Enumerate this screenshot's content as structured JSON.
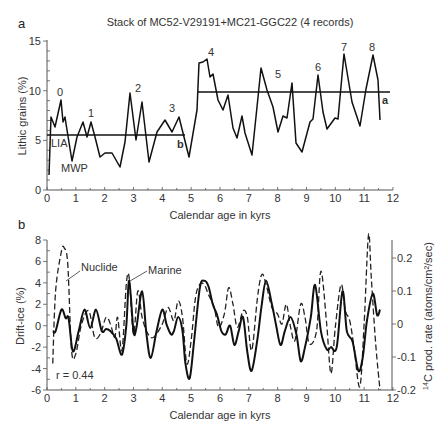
{
  "chart_data": [
    {
      "panel": "a",
      "type": "line",
      "title": "Stack of MC52-V29191+MC21-GGC22 (4 records)",
      "xlabel": "Calendar age in kyrs",
      "ylabel": "Lithic grains (%)",
      "xlim": [
        0,
        12
      ],
      "ylim": [
        0,
        15
      ],
      "xticks": [
        "0",
        "1",
        "2",
        "3",
        "4",
        "5",
        "6",
        "7",
        "8",
        "9",
        "10",
        "11",
        "12"
      ],
      "yticks": [
        "0",
        "5",
        "10",
        "15"
      ],
      "series": [
        {
          "name": "Lithic grains stack",
          "x": [
            0.07,
            0.14,
            0.28,
            0.49,
            0.55,
            0.62,
            0.69,
            0.87,
            1.04,
            1.25,
            1.39,
            1.53,
            1.66,
            1.84,
            2.01,
            2.25,
            2.53,
            2.71,
            2.88,
            3.09,
            3.3,
            3.54,
            3.82,
            4.09,
            4.34,
            4.58,
            4.75,
            4.93,
            5.2,
            5.27,
            5.41,
            5.55,
            5.65,
            5.76,
            5.93,
            6.1,
            6.27,
            6.42,
            6.6,
            6.73,
            6.9,
            7.11,
            7.28,
            7.42,
            7.63,
            7.84,
            8.01,
            8.18,
            8.32,
            8.5,
            8.64,
            8.85,
            9.12,
            9.23,
            9.4,
            9.58,
            9.71,
            9.99,
            10.09,
            10.3,
            10.58,
            10.79,
            11.03,
            11.2,
            11.3,
            11.55
          ],
          "y": [
            1.5,
            7.3,
            6.3,
            9.0,
            6.8,
            7.3,
            6.0,
            2.9,
            5.4,
            6.9,
            5.4,
            6.9,
            5.4,
            3.3,
            3.7,
            3.7,
            2.3,
            4.8,
            9.7,
            5.0,
            8.8,
            2.8,
            5.8,
            7.0,
            5.8,
            7.3,
            5.3,
            3.3,
            8.1,
            12.8,
            12.9,
            13.2,
            11.4,
            11.7,
            9.2,
            8.1,
            9.6,
            6.3,
            5.3,
            7.5,
            5.8,
            3.5,
            8.4,
            12.3,
            10.1,
            8.4,
            5.8,
            7.5,
            7.3,
            10.8,
            4.8,
            3.9,
            6.9,
            7.2,
            11.6,
            7.9,
            6.2,
            7.3,
            7.2,
            13.7,
            8.9,
            6.4,
            10.1,
            13.6,
            11.1,
            7.0
          ]
        }
      ],
      "reference_lines": [
        {
          "label": "b",
          "y": 5.5,
          "x_range": [
            0,
            4.8
          ]
        },
        {
          "label": "a",
          "y": 9.9,
          "x_range": [
            5.2,
            12
          ]
        }
      ],
      "annotations": [
        "0",
        "1",
        "2",
        "3",
        "4",
        "5",
        "6",
        "7",
        "8",
        "LIA",
        "MWP",
        "a",
        "b"
      ]
    },
    {
      "panel": "b",
      "type": "line",
      "xlabel": "Calendar age in kyrs",
      "ylabel": "Drift-ice (%)",
      "ylabel_right": "14C prod. rate (atoms/cm2/sec)",
      "xlim": [
        0,
        12
      ],
      "ylim": [
        -6,
        8
      ],
      "ylim_right": [
        -0.2,
        0.25
      ],
      "xticks": [
        "0",
        "1",
        "2",
        "3",
        "4",
        "5",
        "6",
        "7",
        "8",
        "9",
        "10",
        "11",
        "12"
      ],
      "yticks": [
        "-6",
        "-4",
        "-2",
        "0",
        "2",
        "4",
        "6",
        "8"
      ],
      "yticks_right": [
        "-0.2",
        "-0.1",
        "0",
        "0.1",
        "0.2"
      ],
      "series": [
        {
          "name": "Marine",
          "style": "solid",
          "axis": "left",
          "x": [
            0.2,
            0.3,
            0.5,
            0.65,
            0.75,
            0.9,
            1.1,
            1.3,
            1.5,
            1.7,
            1.9,
            2.05,
            2.2,
            2.4,
            2.6,
            2.75,
            2.85,
            3.0,
            3.1,
            3.3,
            3.45,
            3.6,
            3.8,
            4.0,
            4.15,
            4.3,
            4.4,
            4.55,
            4.7,
            4.8,
            4.95,
            5.1,
            5.3,
            5.45,
            5.6,
            5.75,
            5.9,
            6.05,
            6.2,
            6.35,
            6.5,
            6.65,
            6.8,
            6.95,
            7.1,
            7.3,
            7.45,
            7.6,
            7.8,
            7.95,
            8.1,
            8.25,
            8.45,
            8.65,
            8.8,
            8.95,
            9.15,
            9.3,
            9.5,
            9.7,
            9.85,
            10.05,
            10.25,
            10.4,
            10.6,
            10.8,
            10.95,
            11.1,
            11.3,
            11.45,
            11.55
          ],
          "y": [
            -0.5,
            -0.5,
            1.5,
            0.7,
            0.7,
            -2.4,
            -0.5,
            1.5,
            -0.2,
            1.5,
            -0.5,
            -0.3,
            -0.5,
            -1.2,
            -2.7,
            0.0,
            4.2,
            -0.5,
            -0.2,
            3.2,
            -0.8,
            -3.0,
            -0.5,
            1.5,
            0.1,
            -0.8,
            -0.5,
            0.8,
            -0.5,
            -3.5,
            -4.9,
            -1.5,
            3.5,
            4.2,
            3.7,
            2.0,
            1.0,
            -0.5,
            -0.8,
            0.0,
            -1.8,
            -0.5,
            0.8,
            -2.5,
            -4.2,
            -1.2,
            2.0,
            4.2,
            2.0,
            0.0,
            -1.8,
            -0.5,
            0.8,
            -0.8,
            -3.3,
            -2.0,
            0.8,
            3.8,
            -0.5,
            -2.2,
            -2.0,
            -2.0,
            3.2,
            -0.5,
            -1.5,
            -4.2,
            -3.0,
            0.5,
            3.0,
            1.0,
            1.5
          ]
        },
        {
          "name": "Nuclide",
          "style": "dashed",
          "axis": "right",
          "x": [
            0.2,
            0.3,
            0.5,
            0.6,
            0.72,
            0.85,
            1.0,
            1.2,
            1.45,
            1.65,
            1.85,
            2.05,
            2.2,
            2.35,
            2.45,
            2.6,
            2.75,
            2.85,
            3.0,
            3.15,
            3.3,
            3.5,
            3.7,
            4.0,
            4.2,
            4.4,
            4.55,
            4.7,
            4.85,
            5.0,
            5.15,
            5.3,
            5.45,
            5.6,
            5.8,
            5.95,
            6.15,
            6.3,
            6.45,
            6.6,
            6.8,
            6.95,
            7.1,
            7.3,
            7.45,
            7.6,
            7.8,
            8.0,
            8.15,
            8.3,
            8.45,
            8.6,
            8.8,
            8.95,
            9.1,
            9.35,
            9.5,
            9.7,
            9.85,
            10.0,
            10.2,
            10.35,
            10.5,
            10.65,
            10.85,
            11.0,
            11.15,
            11.25,
            11.4,
            11.55
          ],
          "y": [
            -0.12,
            0.1,
            0.22,
            0.23,
            0.18,
            -0.08,
            -0.09,
            0.0,
            0.04,
            -0.04,
            -0.03,
            0.02,
            0.0,
            -0.04,
            0.02,
            -0.08,
            0.12,
            0.14,
            -0.03,
            0.1,
            0.02,
            -0.03,
            -0.04,
            0.0,
            0.05,
            0.01,
            0.07,
            0.02,
            -0.12,
            -0.05,
            0.08,
            0.12,
            0.12,
            0.09,
            0.05,
            -0.01,
            0.03,
            0.11,
            0.06,
            -0.01,
            0.04,
            0.02,
            -0.08,
            0.08,
            0.15,
            0.12,
            0.05,
            0.03,
            0.0,
            0.06,
            -0.01,
            -0.05,
            0.06,
            0.02,
            -0.06,
            -0.02,
            0.16,
            0.0,
            -0.15,
            -0.01,
            0.12,
            0.04,
            0.01,
            -0.07,
            -0.19,
            0.0,
            0.27,
            0.14,
            -0.06,
            -0.2
          ]
        }
      ],
      "annotations": [
        "Nuclide",
        "Marine",
        "r = 0.44"
      ]
    }
  ],
  "figure": {
    "panel_a_label": "a",
    "panel_b_label": "b",
    "title": "Stack of MC52-V29191+MC21-GGC22 (4 records)",
    "a_xlabel": "Calendar age in kyrs",
    "a_ylabel": "Lithic grains (%)",
    "b_xlabel": "Calendar age in kyrs",
    "b_ylabel_left": "Drift-ice (%)",
    "b_ylabel_right_sup": "14",
    "b_ylabel_right": "C prod. rate (atoms/cm²/sec)",
    "event_labels": {
      "e0": "0",
      "e1": "1",
      "e2": "2",
      "e3": "3",
      "e4": "4",
      "e5": "5",
      "e6": "6",
      "e7": "7",
      "e8": "8"
    },
    "lia": "LIA",
    "mwp": "MWP",
    "line_a": "a",
    "line_b": "b",
    "nuclide": "Nuclide",
    "marine": "Marine",
    "r_value": "r = 0.44",
    "xticks": [
      "0",
      "1",
      "2",
      "3",
      "4",
      "5",
      "6",
      "7",
      "8",
      "9",
      "10",
      "11",
      "12"
    ],
    "a_yticks": [
      "0",
      "5",
      "10",
      "15"
    ],
    "b_yticks": [
      "-6",
      "-4",
      "-2",
      "0",
      "2",
      "4",
      "6",
      "8"
    ],
    "b_yticks_right": [
      "-0.2",
      "-0.1",
      "0",
      "0.1",
      "0.2"
    ]
  }
}
